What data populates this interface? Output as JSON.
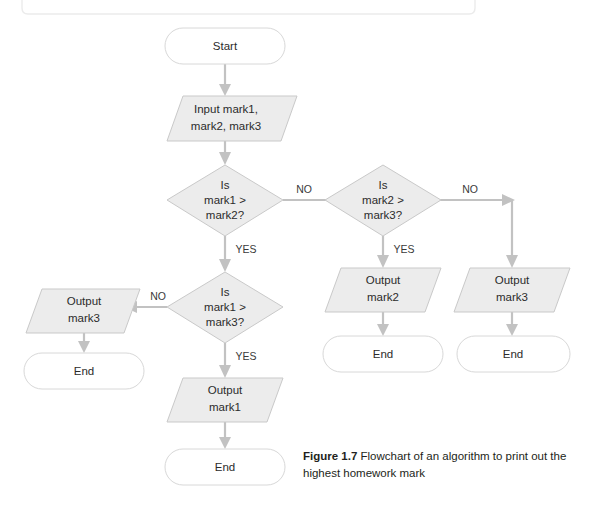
{
  "figure": {
    "label": "Figure 1.7",
    "caption": "Flowchart of an algorithm to print out the highest homework mark"
  },
  "colors": {
    "shape_fill": "#ececec",
    "shape_stroke": "#c9c9c9",
    "terminator_fill": "#ffffff",
    "terminator_stroke": "#d8d8d8",
    "connector": "#c2c2c2",
    "text": "#2b2b2b",
    "page_background": "#ffffff",
    "top_box_stroke": "#ebebeb"
  },
  "flowchart": {
    "type": "flowchart",
    "title": "Flowchart of an algorithm to print out the highest homework mark",
    "nodes": [
      {
        "id": "start",
        "shape": "terminator",
        "text": "Start"
      },
      {
        "id": "input",
        "shape": "parallelogram",
        "line1": "Input mark1,",
        "line2": "mark2, mark3"
      },
      {
        "id": "dec1",
        "shape": "diamond",
        "line1": "Is",
        "line2": "mark1 >",
        "line3": "mark2?"
      },
      {
        "id": "dec2",
        "shape": "diamond",
        "line1": "Is",
        "line2": "mark2 >",
        "line3": "mark3?"
      },
      {
        "id": "dec3",
        "shape": "diamond",
        "line1": "Is",
        "line2": "mark1 >",
        "line3": "mark3?"
      },
      {
        "id": "out2",
        "shape": "parallelogram",
        "line1": "Output",
        "line2": "mark2"
      },
      {
        "id": "out3r",
        "shape": "parallelogram",
        "line1": "Output",
        "line2": "mark3"
      },
      {
        "id": "out3l",
        "shape": "parallelogram",
        "line1": "Output",
        "line2": "mark3"
      },
      {
        "id": "out1",
        "shape": "parallelogram",
        "line1": "Output",
        "line2": "mark1"
      },
      {
        "id": "end_left",
        "shape": "terminator",
        "text": "End"
      },
      {
        "id": "end_mid",
        "shape": "terminator",
        "text": "End"
      },
      {
        "id": "end_right",
        "shape": "terminator",
        "text": "End"
      },
      {
        "id": "end_bot",
        "shape": "terminator",
        "text": "End"
      }
    ],
    "edges": [
      {
        "from": "start",
        "to": "input",
        "label": ""
      },
      {
        "from": "input",
        "to": "dec1",
        "label": ""
      },
      {
        "from": "dec1",
        "to": "dec2",
        "label": "NO"
      },
      {
        "from": "dec1",
        "to": "dec3",
        "label": "YES"
      },
      {
        "from": "dec2",
        "to": "out2",
        "label": "YES"
      },
      {
        "from": "dec2",
        "to": "out3r",
        "label": "NO"
      },
      {
        "from": "dec3",
        "to": "out3l",
        "label": "NO"
      },
      {
        "from": "dec3",
        "to": "out1",
        "label": "YES"
      },
      {
        "from": "out2",
        "to": "end_mid",
        "label": ""
      },
      {
        "from": "out3r",
        "to": "end_right",
        "label": ""
      },
      {
        "from": "out3l",
        "to": "end_left",
        "label": ""
      },
      {
        "from": "out1",
        "to": "end_bot",
        "label": ""
      }
    ]
  },
  "labels": {
    "start": "Start",
    "input_l1": "Input mark1,",
    "input_l2": "mark2, mark3",
    "dec1_l1": "Is",
    "dec1_l2": "mark1 >",
    "dec1_l3": "mark2?",
    "dec2_l1": "Is",
    "dec2_l2": "mark2 >",
    "dec2_l3": "mark3?",
    "dec3_l1": "Is",
    "dec3_l2": "mark1 >",
    "dec3_l3": "mark3?",
    "out2_l1": "Output",
    "out2_l2": "mark2",
    "out3r_l1": "Output",
    "out3r_l2": "mark3",
    "out3l_l1": "Output",
    "out3l_l2": "mark3",
    "out1_l1": "Output",
    "out1_l2": "mark1",
    "end_left": "End",
    "end_mid": "End",
    "end_right": "End",
    "end_bot": "End",
    "no_1": "NO",
    "no_2": "NO",
    "no_3": "NO",
    "yes_1": "YES",
    "yes_2": "YES",
    "yes_3": "YES"
  }
}
